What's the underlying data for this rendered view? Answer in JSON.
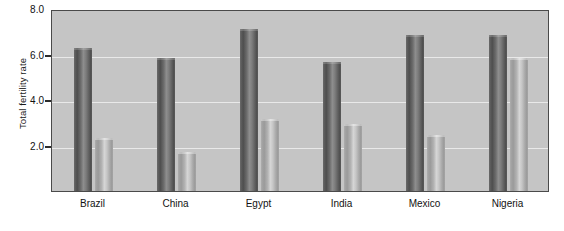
{
  "chart_data": {
    "type": "bar",
    "title": "",
    "subtitle": "",
    "xlabel": "",
    "ylabel": "Total fertility rate",
    "ylim": [
      0.0,
      8.0
    ],
    "yticks": [
      2.0,
      4.0,
      6.0,
      8.0
    ],
    "ytick_labels": [
      "2.0",
      "4.0",
      "6.0",
      "8.0"
    ],
    "grid": true,
    "legend": "none",
    "categories": [
      "Brazil",
      "China",
      "Egypt",
      "India",
      "Mexico",
      "Nigeria"
    ],
    "series": [
      {
        "name": "Earlier period",
        "color": "#5e5e5e",
        "values": [
          6.3,
          5.85,
          7.1,
          5.65,
          6.85,
          6.85
        ]
      },
      {
        "name": "Later period",
        "color": "#b0b0b0",
        "values": [
          2.35,
          1.7,
          3.15,
          2.95,
          2.45,
          5.85
        ]
      }
    ]
  },
  "axis": {
    "y_title": "Total fertility rate",
    "y_tick_labels": [
      "8.0",
      "6.0",
      "4.0",
      "2.0"
    ],
    "x_tick_labels": [
      "Brazil",
      "China",
      "Egypt",
      "India",
      "Mexico",
      "Nigeria"
    ]
  },
  "style": {
    "plot_background": "#c5c5c5",
    "plot_border": "#4a4a4a",
    "gridline_color": "#e9e9e9",
    "text_color": "#121212",
    "page_background": "#ffffff"
  }
}
